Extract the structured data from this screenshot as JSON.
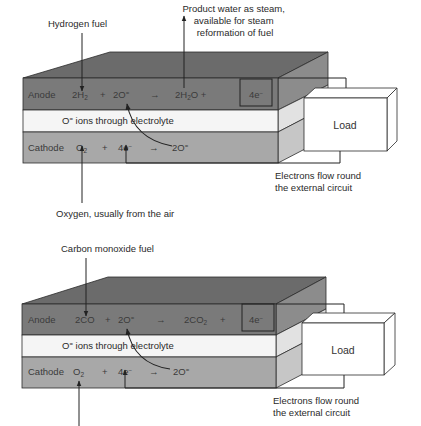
{
  "diagram": {
    "type": "fuel-cell-reaction-schematic",
    "colors": {
      "anode_front": "#7a7a7a",
      "anode_top": "#6b6b6b",
      "anode_side": "#8c8c8c",
      "electrolyte_front": "#f4f4f4",
      "electrolyte_side": "#e0e0e0",
      "cathode_front": "#a6a6a6",
      "cathode_side": "#c4c4c4",
      "outline": "#2b2b2b",
      "load_fill": "#ffffff"
    },
    "cells": [
      {
        "fuel_label": "Hydrogen fuel",
        "product_label_lines": [
          "Product water as steam,",
          "available for steam",
          "reformation of fuel"
        ],
        "anode": {
          "label": "Anode",
          "reactant1": "2H",
          "reactant1_sub": "2",
          "plus1": "+",
          "reactant2": "2O",
          "reactant2_sup": "=",
          "arrow": "→",
          "product": "2H",
          "product_sub": "2",
          "product_tail": "O +",
          "electrons": "4e",
          "electrons_sup": "−"
        },
        "electrolyte": {
          "ion": "O",
          "ion_sup": "=",
          "label": " ions through electrolyte"
        },
        "cathode": {
          "label": "Cathode",
          "reactant1": "O",
          "reactant1_sub": "2",
          "plus": "+",
          "reactant2": "4e",
          "reactant2_sup": "−",
          "arrow": "→",
          "product": "2O",
          "product_sup": "="
        },
        "load_label": "Load",
        "circuit_label_lines": [
          "Electrons flow round",
          "the external circuit"
        ],
        "oxidant_label": "Oxygen, usually from the air"
      },
      {
        "fuel_label": "Carbon monoxide fuel",
        "anode": {
          "label": "Anode",
          "reactant1": "2CO",
          "plus1": "+",
          "reactant2": "2O",
          "reactant2_sup": "=",
          "arrow": "→",
          "product": "2CO",
          "product_sub": "2",
          "product_tail": "+",
          "electrons": "4e",
          "electrons_sup": "−"
        },
        "electrolyte": {
          "ion": "O",
          "ion_sup": "=",
          "label": " ions through electrolyte"
        },
        "cathode": {
          "label": "Cathode",
          "reactant1": "O",
          "reactant1_sub": "2",
          "plus": "+",
          "reactant2": "4e",
          "reactant2_sup": "−",
          "arrow": "→",
          "product": "2O",
          "product_sup": "="
        },
        "load_label": "Load",
        "circuit_label_lines": [
          "Electrons flow round",
          "the external circuit"
        ]
      }
    ]
  }
}
